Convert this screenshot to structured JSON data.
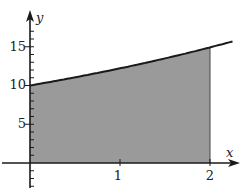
{
  "chart_data": {
    "type": "area",
    "title": "",
    "xlabel": "x",
    "ylabel": "y",
    "function": "y = 10e^(0.2x)",
    "shaded_region": {
      "x_from": 0,
      "x_to": 2,
      "description": "area under curve from x=0 to x=2"
    },
    "x": [
      0,
      0.25,
      0.5,
      0.75,
      1,
      1.25,
      1.5,
      1.75,
      2,
      2.25
    ],
    "values": [
      10,
      10.51,
      11.05,
      11.62,
      12.21,
      12.84,
      13.5,
      14.19,
      14.92,
      15.68
    ],
    "x_ticks": [
      1,
      2
    ],
    "x_tick_labels": [
      "1",
      "2"
    ],
    "y_ticks": [
      5,
      10,
      15
    ],
    "y_tick_labels": [
      "5",
      "10",
      "15"
    ],
    "xlim": [
      -0.3,
      2.45
    ],
    "ylim": [
      -3.5,
      18
    ],
    "grid": false,
    "colors": {
      "fill": "#9a9a9a",
      "curve": "#1a1a1a",
      "axes": "#1a1a1a"
    }
  }
}
